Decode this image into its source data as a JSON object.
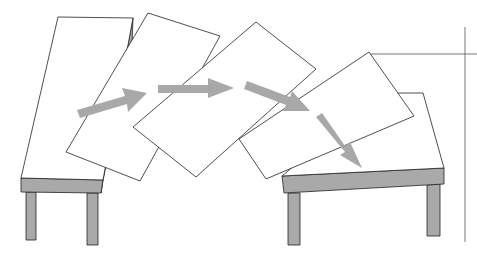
{
  "diagram": {
    "colors": {
      "background": "#ffffff",
      "stroke": "#222222",
      "surface": "#ffffff",
      "wood_side": "#a9a9a9",
      "arrow": "#a8a8a8"
    },
    "stages": 5,
    "arrows": 4,
    "guide_lines": [
      "vertical",
      "horizontal"
    ]
  }
}
